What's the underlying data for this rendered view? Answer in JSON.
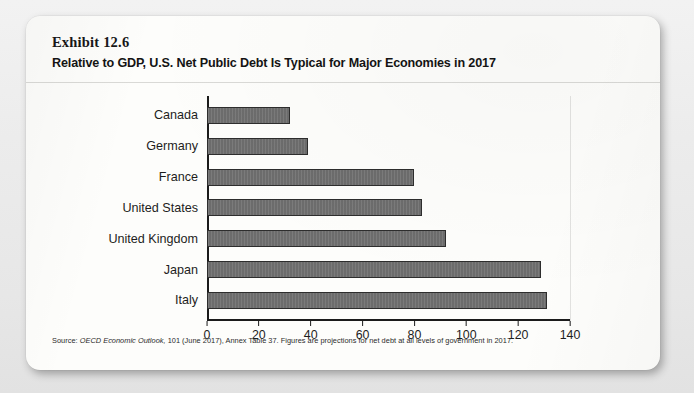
{
  "exhibit": {
    "label": "Exhibit 12.6",
    "title": "Relative to GDP, U.S. Net Public Debt Is Typical for Major Economies in 2017"
  },
  "source": {
    "prefix": "Source: ",
    "italic_part": "OECD Economic Outlook,",
    "rest": " 101 (June 2017), Annex Table 37. Figures are projections for net debt at all levels of government in 2017."
  },
  "chart_data": {
    "type": "bar",
    "orientation": "horizontal",
    "title": "Relative to GDP, U.S. Net Public Debt Is Typical for Major Economies in 2017",
    "xlabel": "",
    "ylabel": "",
    "xlim": [
      0,
      140
    ],
    "xticks": [
      0,
      20,
      40,
      60,
      80,
      100,
      120,
      140
    ],
    "grid": false,
    "legend": false,
    "bar_color": "#6e6e6e",
    "bar_edge_color": "#2d2d2d",
    "categories": [
      "Canada",
      "Germany",
      "France",
      "United States",
      "United Kingdom",
      "Japan",
      "Italy"
    ],
    "values": [
      32,
      39,
      80,
      83,
      92,
      129,
      131
    ]
  }
}
